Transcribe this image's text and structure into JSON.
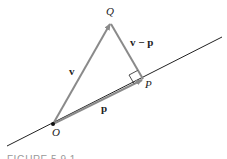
{
  "figure": {
    "caption": "FIGURE 5.9.1",
    "points": {
      "O": "O",
      "P": "P",
      "Q": "Q"
    },
    "vectors": {
      "v": "v",
      "p": "p",
      "v_minus_p": "v − p"
    },
    "colors": {
      "line": "#222222",
      "vector": "#8a8a8a",
      "text": "#222222"
    }
  }
}
